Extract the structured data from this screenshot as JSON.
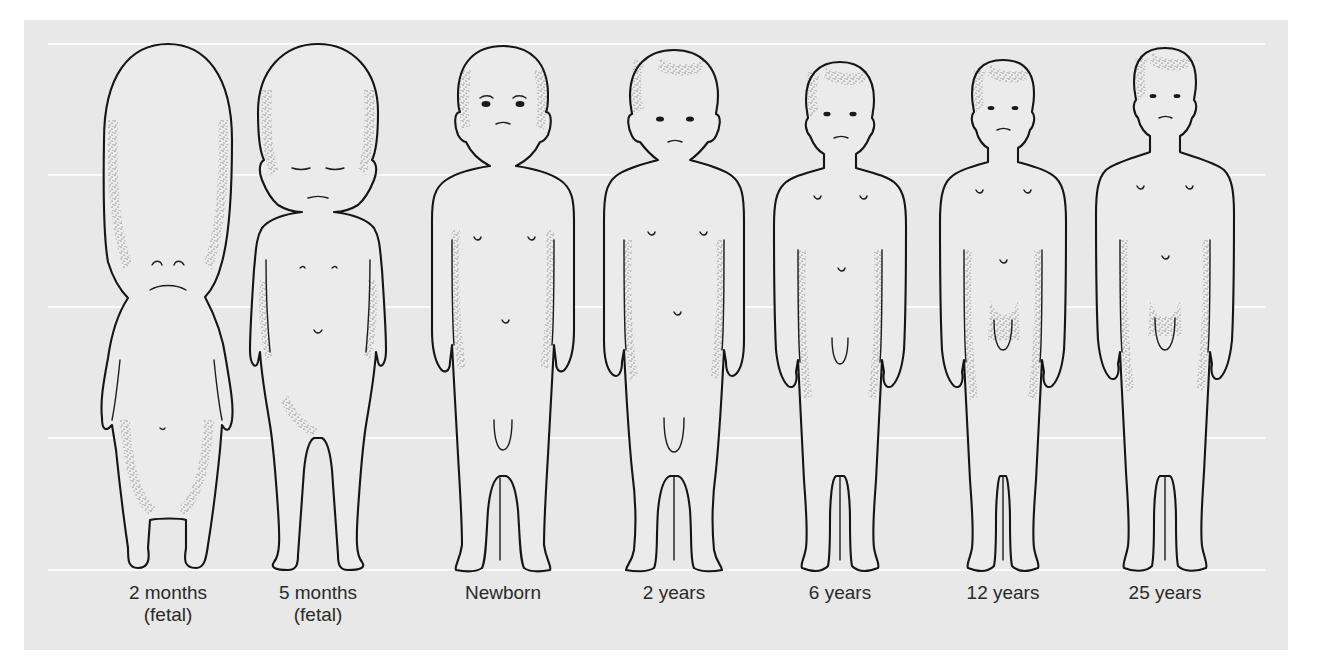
{
  "figure": {
    "type": "anatomical-illustration",
    "background_color": "#e8e8e8",
    "line_color": "#151515",
    "guide_line_color": "#fbfbfb",
    "guide_lines_count": 5,
    "stages": [
      {
        "id": "2mo",
        "label_line1": "2 months",
        "label_line2": "(fetal)"
      },
      {
        "id": "5mo",
        "label_line1": "5 months",
        "label_line2": "(fetal)"
      },
      {
        "id": "newborn",
        "label_line1": "Newborn",
        "label_line2": ""
      },
      {
        "id": "2y",
        "label_line1": "2 years",
        "label_line2": ""
      },
      {
        "id": "6y",
        "label_line1": "6 years",
        "label_line2": ""
      },
      {
        "id": "12y",
        "label_line1": "12 years",
        "label_line2": ""
      },
      {
        "id": "25y",
        "label_line1": "25 years",
        "label_line2": ""
      }
    ]
  }
}
